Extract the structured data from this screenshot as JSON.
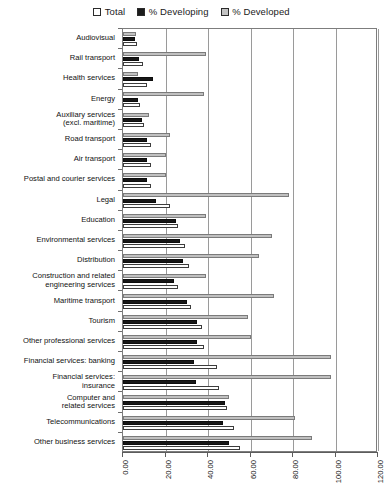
{
  "legend": {
    "items": [
      {
        "label": "Total",
        "key": "total",
        "color": "#ffffff"
      },
      {
        "label": "% Developing",
        "key": "developing",
        "color": "#171717"
      },
      {
        "label": "% Developed",
        "key": "developed",
        "color": "#c0c0c0"
      }
    ]
  },
  "chart_data": {
    "type": "bar",
    "orientation": "horizontal",
    "title": "",
    "subtitle": "",
    "xlabel": "",
    "ylabel": "",
    "xlim": [
      0,
      120
    ],
    "xticks": [
      0,
      20,
      40,
      60,
      80,
      100,
      120
    ],
    "xtick_labels": [
      "0.00",
      "20.00",
      "40.00",
      "60.00",
      "80.00",
      "100.00",
      "120.00"
    ],
    "grid": true,
    "legend_position": "top-center",
    "legend_entries": [
      "Total",
      "% Developing",
      "% Developed"
    ],
    "categories": [
      "Audiovisual",
      "Rail transport",
      "Health services",
      "Energy",
      "Auxiliary services\n(excl. maritime)",
      "Road transport",
      "Air transport",
      "Postal and courier services",
      "Legal",
      "Education",
      "Environmental services",
      "Distribution",
      "Construction and related\nengineering services",
      "Maritime transport",
      "Tourism",
      "Other professional services",
      "Financial services: banking",
      "Financial services:\ninsurance",
      "Computer and\nrelated services",
      "Telecommunications",
      "Other business services"
    ],
    "series": [
      {
        "name": "Total",
        "color": "#ffffff",
        "values": [
          6.5,
          9.5,
          11.5,
          8.0,
          10.0,
          13.0,
          13.0,
          13.0,
          22.0,
          26.0,
          29.0,
          31.0,
          26.0,
          32.0,
          37.0,
          38.0,
          44.0,
          45.0,
          49.0,
          52.0,
          55.0
        ]
      },
      {
        "name": "% Developing",
        "color": "#171717",
        "values": [
          5.5,
          7.5,
          14.0,
          7.0,
          9.0,
          11.5,
          11.5,
          11.5,
          15.5,
          25.0,
          27.0,
          28.0,
          24.0,
          30.0,
          35.0,
          35.0,
          33.5,
          34.5,
          48.0,
          47.0,
          50.0
        ]
      },
      {
        "name": "% Developed",
        "color": "#c0c0c0",
        "values": [
          6.0,
          39.0,
          7.0,
          38.0,
          12.0,
          22.0,
          20.0,
          20.0,
          78.0,
          39.0,
          70.0,
          64.0,
          39.0,
          71.0,
          59.0,
          60.0,
          98.0,
          98.0,
          50.0,
          81.0,
          89.0
        ]
      }
    ]
  }
}
